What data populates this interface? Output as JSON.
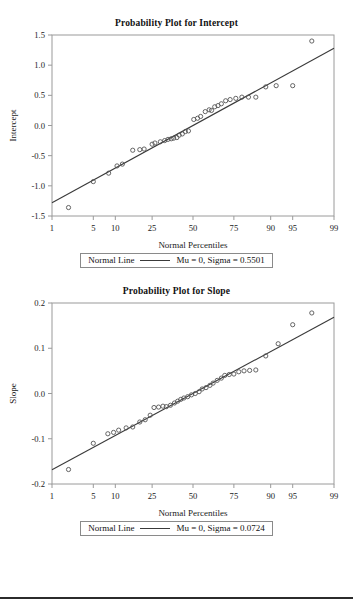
{
  "page": {
    "width": 353,
    "height": 606,
    "background": "#ffffff",
    "divider_color": "#2b2b2b"
  },
  "chart_data": [
    {
      "type": "scatter",
      "id": "intercept",
      "title": "Probability Plot for Intercept",
      "xlabel": "Normal Percentiles",
      "ylabel": "Intercept",
      "grid": false,
      "x_scale": "normal-probability",
      "xticks": [
        1,
        5,
        10,
        25,
        50,
        75,
        90,
        95,
        99
      ],
      "xticklabels": [
        "1",
        "5",
        "10",
        "25",
        "50",
        "75",
        "90",
        "95",
        "99"
      ],
      "xlim": [
        1,
        99
      ],
      "yticks": [
        -1.5,
        -1.0,
        -0.5,
        0.0,
        0.5,
        1.0,
        1.5
      ],
      "yticklabels": [
        "-1.5",
        "-1.0",
        "-0.5",
        "0.0",
        "0.5",
        "1.0",
        "1.5"
      ],
      "ylim": [
        -1.5,
        1.5
      ],
      "marker": "open-circle",
      "marker_color": "#555555",
      "line_color": "#3a3a3a",
      "legend": {
        "position": "below",
        "series_label": "Normal Line",
        "params_label": "Mu = 0, Sigma = 0.5501"
      },
      "fit_line": {
        "mu": 0,
        "sigma": 0.5501
      },
      "points": [
        {
          "p": 2.0,
          "y": -1.36
        },
        {
          "p": 5.0,
          "y": -0.93
        },
        {
          "p": 8.2,
          "y": -0.79
        },
        {
          "p": 10.5,
          "y": -0.67
        },
        {
          "p": 12.2,
          "y": -0.64
        },
        {
          "p": 16.0,
          "y": -0.41
        },
        {
          "p": 19.0,
          "y": -0.4
        },
        {
          "p": 21.0,
          "y": -0.39
        },
        {
          "p": 25.0,
          "y": -0.31
        },
        {
          "p": 26.5,
          "y": -0.29
        },
        {
          "p": 29.5,
          "y": -0.27
        },
        {
          "p": 32.0,
          "y": -0.25
        },
        {
          "p": 34.0,
          "y": -0.23
        },
        {
          "p": 36.0,
          "y": -0.22
        },
        {
          "p": 37.5,
          "y": -0.21
        },
        {
          "p": 39.5,
          "y": -0.2
        },
        {
          "p": 41.0,
          "y": -0.16
        },
        {
          "p": 43.0,
          "y": -0.14
        },
        {
          "p": 45.0,
          "y": -0.1
        },
        {
          "p": 47.0,
          "y": -0.09
        },
        {
          "p": 50.5,
          "y": 0.1
        },
        {
          "p": 53.0,
          "y": 0.12
        },
        {
          "p": 55.0,
          "y": 0.15
        },
        {
          "p": 58.0,
          "y": 0.23
        },
        {
          "p": 60.5,
          "y": 0.26
        },
        {
          "p": 62.0,
          "y": 0.25
        },
        {
          "p": 64.0,
          "y": 0.31
        },
        {
          "p": 66.0,
          "y": 0.33
        },
        {
          "p": 68.0,
          "y": 0.36
        },
        {
          "p": 70.5,
          "y": 0.41
        },
        {
          "p": 73.0,
          "y": 0.43
        },
        {
          "p": 76.0,
          "y": 0.45
        },
        {
          "p": 79.0,
          "y": 0.47
        },
        {
          "p": 82.0,
          "y": 0.47
        },
        {
          "p": 85.0,
          "y": 0.47
        },
        {
          "p": 88.5,
          "y": 0.64
        },
        {
          "p": 91.5,
          "y": 0.66
        },
        {
          "p": 95.0,
          "y": 0.66
        },
        {
          "p": 97.5,
          "y": 1.4
        }
      ]
    },
    {
      "type": "scatter",
      "id": "slope",
      "title": "Probability Plot for Slope",
      "xlabel": "Normal Percentiles",
      "ylabel": "Slope",
      "grid": false,
      "x_scale": "normal-probability",
      "xticks": [
        1,
        5,
        10,
        25,
        50,
        75,
        90,
        95,
        99
      ],
      "xticklabels": [
        "1",
        "5",
        "10",
        "25",
        "50",
        "75",
        "90",
        "95",
        "99"
      ],
      "xlim": [
        1,
        99
      ],
      "yticks": [
        -0.2,
        -0.1,
        0.0,
        0.1,
        0.2
      ],
      "yticklabels": [
        "-0.2",
        "-0.1",
        "0.0",
        "0.1",
        "0.2"
      ],
      "ylim": [
        -0.2,
        0.2
      ],
      "marker": "open-circle",
      "marker_color": "#555555",
      "line_color": "#3a3a3a",
      "legend": {
        "position": "below",
        "series_label": "Normal Line",
        "params_label": "Mu = 0, Sigma = 0.0724"
      },
      "fit_line": {
        "mu": 0,
        "sigma": 0.0724
      },
      "points": [
        {
          "p": 2.0,
          "y": -0.168
        },
        {
          "p": 5.0,
          "y": -0.11
        },
        {
          "p": 8.0,
          "y": -0.089
        },
        {
          "p": 9.5,
          "y": -0.086
        },
        {
          "p": 11.0,
          "y": -0.081
        },
        {
          "p": 13.5,
          "y": -0.076
        },
        {
          "p": 16.0,
          "y": -0.074
        },
        {
          "p": 19.0,
          "y": -0.063
        },
        {
          "p": 21.5,
          "y": -0.058
        },
        {
          "p": 24.0,
          "y": -0.048
        },
        {
          "p": 26.0,
          "y": -0.031
        },
        {
          "p": 28.5,
          "y": -0.03
        },
        {
          "p": 31.0,
          "y": -0.028
        },
        {
          "p": 33.0,
          "y": -0.029
        },
        {
          "p": 35.5,
          "y": -0.026
        },
        {
          "p": 38.0,
          "y": -0.021
        },
        {
          "p": 40.0,
          "y": -0.017
        },
        {
          "p": 42.0,
          "y": -0.013
        },
        {
          "p": 44.0,
          "y": -0.01
        },
        {
          "p": 46.5,
          "y": -0.007
        },
        {
          "p": 49.0,
          "y": -0.003
        },
        {
          "p": 51.5,
          "y": 0.0
        },
        {
          "p": 54.0,
          "y": 0.004
        },
        {
          "p": 56.0,
          "y": 0.01
        },
        {
          "p": 58.5,
          "y": 0.013
        },
        {
          "p": 61.0,
          "y": 0.018
        },
        {
          "p": 63.0,
          "y": 0.023
        },
        {
          "p": 65.5,
          "y": 0.029
        },
        {
          "p": 68.0,
          "y": 0.034
        },
        {
          "p": 70.0,
          "y": 0.04
        },
        {
          "p": 72.5,
          "y": 0.042
        },
        {
          "p": 75.0,
          "y": 0.043
        },
        {
          "p": 77.5,
          "y": 0.048
        },
        {
          "p": 80.0,
          "y": 0.05
        },
        {
          "p": 82.5,
          "y": 0.051
        },
        {
          "p": 85.0,
          "y": 0.052
        },
        {
          "p": 88.5,
          "y": 0.083
        },
        {
          "p": 92.0,
          "y": 0.11
        },
        {
          "p": 95.0,
          "y": 0.152
        },
        {
          "p": 97.5,
          "y": 0.178
        }
      ]
    }
  ]
}
